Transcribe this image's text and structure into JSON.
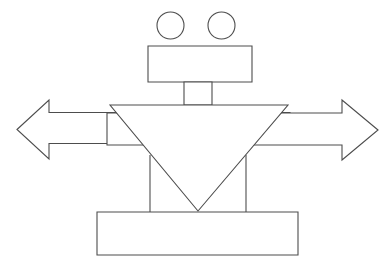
{
  "figure": {
    "title": "Line drawing of a robot-like figure composed of geometric shapes",
    "background_color": "#ffffff",
    "stroke_color": "#4d4d4d",
    "fill_color": "#ffffff",
    "stroke_width": 1.1,
    "canvas": {
      "width": 391,
      "height": 273
    },
    "shapes": [
      {
        "name": "left-eye-circle",
        "type": "circle",
        "label": "left circle",
        "cx": 170.5,
        "cy": 25.5,
        "r": 13.5
      },
      {
        "name": "right-eye-circle",
        "type": "circle",
        "label": "right circle",
        "cx": 221.5,
        "cy": 25.5,
        "r": 13.5
      },
      {
        "name": "head-rectangle",
        "type": "rect",
        "label": "head rectangle",
        "x": 148,
        "y": 46,
        "width": 104,
        "height": 36
      },
      {
        "name": "neck-rectangle",
        "type": "rect",
        "label": "neck rectangle",
        "x": 184,
        "y": 82,
        "width": 28,
        "height": 23
      },
      {
        "name": "left-arrow",
        "type": "polygon",
        "label": "left pointing arrow",
        "points": "17,129.5 49,100 49,112.5 290,112.5 290,143.5 49,143.5 49,159"
      },
      {
        "name": "right-arrow",
        "type": "polygon",
        "label": "right pointing arrow",
        "points": "378,130 342,100 342,113 107,113 107,145 342,145 342,160"
      },
      {
        "name": "left-leg-line",
        "type": "line",
        "label": "left leg vertical line",
        "x1": 150,
        "y1": 155,
        "x2": 150,
        "y2": 212
      },
      {
        "name": "right-leg-line",
        "type": "line",
        "label": "right leg vertical line",
        "x1": 246,
        "y1": 155,
        "x2": 246,
        "y2": 212
      },
      {
        "name": "torso-triangle",
        "type": "polygon",
        "label": "inverted triangle torso",
        "points": "110,105 288,105 198,211"
      },
      {
        "name": "base-rectangle",
        "type": "rect",
        "label": "base rectangle",
        "x": 97,
        "y": 212,
        "width": 201,
        "height": 43
      }
    ]
  }
}
